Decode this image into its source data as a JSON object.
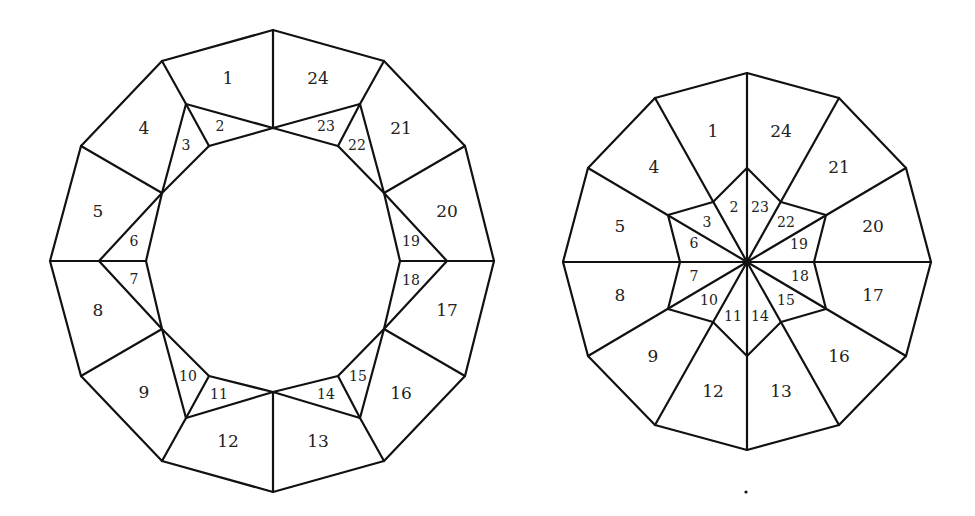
{
  "figures": [
    {
      "id": "left",
      "name": "ring-dodecagon-figure",
      "lines": [
        [
          [
            273,
            30
          ],
          [
            384,
            61
          ],
          [
            465,
            146
          ],
          [
            494,
            261
          ],
          [
            465,
            376
          ],
          [
            384,
            461
          ],
          [
            273,
            492
          ],
          [
            162,
            461
          ],
          [
            81,
            376
          ],
          [
            50,
            261
          ],
          [
            81,
            146
          ],
          [
            162,
            61
          ],
          [
            273,
            30
          ]
        ],
        [
          [
            273,
            30
          ],
          [
            273,
            128
          ]
        ],
        [
          [
            273,
            392
          ],
          [
            273,
            492
          ]
        ],
        [
          [
            162,
            61
          ],
          [
            186,
            104
          ]
        ],
        [
          [
            384,
            61
          ],
          [
            360,
            104
          ]
        ],
        [
          [
            162,
            461
          ],
          [
            186,
            418
          ]
        ],
        [
          [
            384,
            461
          ],
          [
            360,
            418
          ]
        ],
        [
          [
            81,
            146
          ],
          [
            162,
            193
          ]
        ],
        [
          [
            465,
            146
          ],
          [
            384,
            193
          ]
        ],
        [
          [
            81,
            376
          ],
          [
            162,
            329
          ]
        ],
        [
          [
            465,
            376
          ],
          [
            384,
            329
          ]
        ],
        [
          [
            50,
            261
          ],
          [
            99,
            261
          ]
        ],
        [
          [
            494,
            261
          ],
          [
            447,
            261
          ]
        ],
        [
          [
            186,
            104
          ],
          [
            273,
            128
          ],
          [
            360,
            104
          ]
        ],
        [
          [
            186,
            104
          ],
          [
            209,
            146
          ]
        ],
        [
          [
            360,
            104
          ],
          [
            338,
            146
          ]
        ],
        [
          [
            186,
            104
          ],
          [
            162,
            193
          ]
        ],
        [
          [
            360,
            104
          ],
          [
            384,
            193
          ]
        ],
        [
          [
            273,
            128
          ],
          [
            209,
            146
          ],
          [
            162,
            193
          ],
          [
            146,
            261
          ],
          [
            162,
            329
          ],
          [
            209,
            376
          ],
          [
            273,
            392
          ],
          [
            338,
            376
          ],
          [
            384,
            329
          ],
          [
            400,
            261
          ],
          [
            384,
            193
          ],
          [
            338,
            146
          ],
          [
            273,
            128
          ]
        ],
        [
          [
            162,
            193
          ],
          [
            99,
            261
          ],
          [
            162,
            329
          ]
        ],
        [
          [
            384,
            193
          ],
          [
            447,
            261
          ],
          [
            384,
            329
          ]
        ],
        [
          [
            99,
            261
          ],
          [
            146,
            261
          ]
        ],
        [
          [
            447,
            261
          ],
          [
            400,
            261
          ]
        ],
        [
          [
            186,
            418
          ],
          [
            273,
            392
          ],
          [
            360,
            418
          ]
        ],
        [
          [
            186,
            418
          ],
          [
            209,
            376
          ]
        ],
        [
          [
            360,
            418
          ],
          [
            338,
            376
          ]
        ],
        [
          [
            186,
            418
          ],
          [
            162,
            329
          ]
        ],
        [
          [
            360,
            418
          ],
          [
            384,
            329
          ]
        ]
      ],
      "labels": [
        {
          "t": "1",
          "x": 228,
          "y": 78,
          "s": 17
        },
        {
          "t": "24",
          "x": 318,
          "y": 78,
          "s": 17
        },
        {
          "t": "2",
          "x": 220,
          "y": 126,
          "s": 14
        },
        {
          "t": "23",
          "x": 326,
          "y": 126,
          "s": 14
        },
        {
          "t": "3",
          "x": 186,
          "y": 145,
          "s": 14
        },
        {
          "t": "22",
          "x": 357,
          "y": 145,
          "s": 14
        },
        {
          "t": "4",
          "x": 144,
          "y": 128,
          "s": 17
        },
        {
          "t": "21",
          "x": 401,
          "y": 128,
          "s": 17
        },
        {
          "t": "5",
          "x": 98,
          "y": 211,
          "s": 17
        },
        {
          "t": "20",
          "x": 447,
          "y": 211,
          "s": 17
        },
        {
          "t": "6",
          "x": 134,
          "y": 241,
          "s": 14
        },
        {
          "t": "19",
          "x": 411,
          "y": 241,
          "s": 14
        },
        {
          "t": "7",
          "x": 134,
          "y": 279,
          "s": 14
        },
        {
          "t": "18",
          "x": 411,
          "y": 280,
          "s": 14
        },
        {
          "t": "8",
          "x": 98,
          "y": 310,
          "s": 17
        },
        {
          "t": "17",
          "x": 447,
          "y": 310,
          "s": 17
        },
        {
          "t": "9",
          "x": 144,
          "y": 392,
          "s": 17
        },
        {
          "t": "16",
          "x": 401,
          "y": 393,
          "s": 17
        },
        {
          "t": "10",
          "x": 188,
          "y": 376,
          "s": 14
        },
        {
          "t": "15",
          "x": 358,
          "y": 376,
          "s": 14
        },
        {
          "t": "11",
          "x": 219,
          "y": 394,
          "s": 14
        },
        {
          "t": "14",
          "x": 326,
          "y": 394,
          "s": 14
        },
        {
          "t": "12",
          "x": 228,
          "y": 441,
          "s": 17
        },
        {
          "t": "13",
          "x": 318,
          "y": 441,
          "s": 17
        }
      ]
    },
    {
      "id": "right",
      "name": "star-dodecagon-figure",
      "lines": [
        [
          [
            747,
            73
          ],
          [
            839,
            98
          ],
          [
            906,
            168
          ],
          [
            931,
            262
          ],
          [
            906,
            356
          ],
          [
            839,
            425
          ],
          [
            747,
            450
          ],
          [
            655,
            425
          ],
          [
            588,
            356
          ],
          [
            563,
            262
          ],
          [
            588,
            168
          ],
          [
            655,
            98
          ],
          [
            747,
            73
          ]
        ],
        [
          [
            747,
            73
          ],
          [
            747,
            450
          ]
        ],
        [
          [
            563,
            262
          ],
          [
            931,
            262
          ]
        ],
        [
          [
            655,
            98
          ],
          [
            747,
            262
          ],
          [
            839,
            425
          ]
        ],
        [
          [
            839,
            98
          ],
          [
            747,
            262
          ],
          [
            655,
            425
          ]
        ],
        [
          [
            588,
            168
          ],
          [
            747,
            262
          ],
          [
            906,
            356
          ]
        ],
        [
          [
            906,
            168
          ],
          [
            747,
            262
          ],
          [
            588,
            356
          ]
        ],
        [
          [
            747,
            168
          ],
          [
            781,
            202
          ],
          [
            826,
            215
          ],
          [
            814,
            262
          ],
          [
            826,
            309
          ],
          [
            781,
            322
          ],
          [
            747,
            356
          ],
          [
            713,
            322
          ],
          [
            668,
            309
          ],
          [
            680,
            262
          ],
          [
            668,
            215
          ],
          [
            713,
            202
          ],
          [
            747,
            168
          ]
        ]
      ],
      "labels": [
        {
          "t": "1",
          "x": 713,
          "y": 131,
          "s": 17
        },
        {
          "t": "24",
          "x": 781,
          "y": 131,
          "s": 17
        },
        {
          "t": "2",
          "x": 734,
          "y": 207,
          "s": 14
        },
        {
          "t": "23",
          "x": 760,
          "y": 207,
          "s": 14
        },
        {
          "t": "3",
          "x": 707,
          "y": 222,
          "s": 14
        },
        {
          "t": "22",
          "x": 786,
          "y": 222,
          "s": 14
        },
        {
          "t": "4",
          "x": 654,
          "y": 167,
          "s": 17
        },
        {
          "t": "21",
          "x": 839,
          "y": 167,
          "s": 17
        },
        {
          "t": "5",
          "x": 620,
          "y": 226,
          "s": 17
        },
        {
          "t": "20",
          "x": 873,
          "y": 226,
          "s": 17
        },
        {
          "t": "6",
          "x": 694,
          "y": 243,
          "s": 14
        },
        {
          "t": "19",
          "x": 799,
          "y": 244,
          "s": 14
        },
        {
          "t": "7",
          "x": 694,
          "y": 276,
          "s": 14
        },
        {
          "t": "18",
          "x": 800,
          "y": 276,
          "s": 14
        },
        {
          "t": "8",
          "x": 620,
          "y": 295,
          "s": 17
        },
        {
          "t": "17",
          "x": 873,
          "y": 295,
          "s": 17
        },
        {
          "t": "10",
          "x": 709,
          "y": 300,
          "s": 14
        },
        {
          "t": "15",
          "x": 786,
          "y": 300,
          "s": 14
        },
        {
          "t": "11",
          "x": 733,
          "y": 316,
          "s": 14
        },
        {
          "t": "14",
          "x": 760,
          "y": 316,
          "s": 14
        },
        {
          "t": "9",
          "x": 653,
          "y": 356,
          "s": 17
        },
        {
          "t": "16",
          "x": 839,
          "y": 356,
          "s": 17
        },
        {
          "t": "12",
          "x": 713,
          "y": 391,
          "s": 17
        },
        {
          "t": "13",
          "x": 781,
          "y": 391,
          "s": 17
        }
      ],
      "center_dot": {
        "x": 747,
        "y": 262,
        "r": 3.5
      }
    }
  ],
  "stray_dot": {
    "x": 746,
    "y": 492,
    "r": 1.6
  },
  "colors": {
    "stroke": "#111111",
    "text": "#222222",
    "background": "#ffffff"
  }
}
